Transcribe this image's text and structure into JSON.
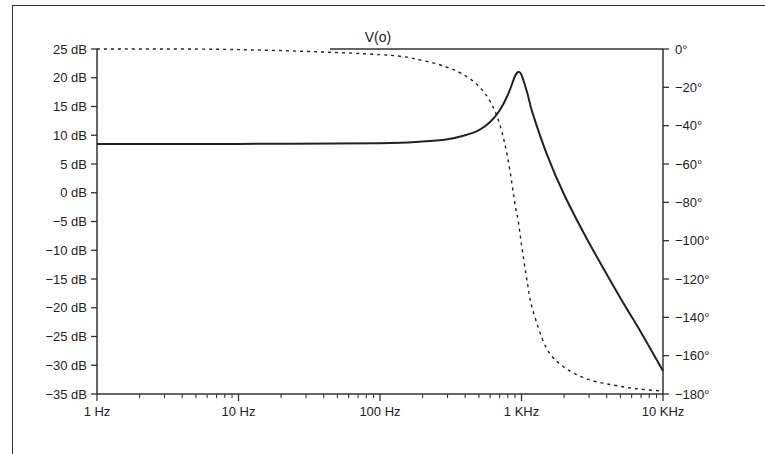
{
  "chart_data": {
    "type": "line",
    "title": "V(o)",
    "xlabel": "",
    "ylabel": "",
    "xscale": "log",
    "x_ticks": [
      "1 Hz",
      "10 Hz",
      "100 Hz",
      "1 KHz",
      "10 KHz"
    ],
    "xlim": [
      1,
      10000
    ],
    "y_left": {
      "unit": "dB",
      "ylim": [
        -35,
        25
      ],
      "ticks": [
        "25 dB",
        "20 dB",
        "15 dB",
        "10 dB",
        "5 dB",
        "0 dB",
        "−5 dB",
        "−10 dB",
        "−15 dB",
        "−20 dB",
        "−25 dB",
        "−30 dB",
        "−35 dB"
      ]
    },
    "y_right": {
      "unit": "deg",
      "ylim": [
        -180,
        0
      ],
      "ticks": [
        "0°",
        "−20°",
        "−40°",
        "−60°",
        "−80°",
        "−100°",
        "−120°",
        "−140°",
        "−160°",
        "−180°"
      ]
    },
    "grid": false,
    "series": [
      {
        "name": "Magnitude",
        "axis": "left",
        "style": "solid",
        "x": [
          1,
          10,
          100,
          200,
          300,
          400,
          500,
          600,
          700,
          800,
          900,
          950,
          1000,
          1100,
          1200,
          1500,
          2000,
          3000,
          5000,
          7000,
          10000
        ],
        "values": [
          8.5,
          8.5,
          8.6,
          8.9,
          9.3,
          10.0,
          10.9,
          12.3,
          14.3,
          17.0,
          20.3,
          21.0,
          20.5,
          17.3,
          13.8,
          6.9,
          -0.3,
          -8.7,
          -18.3,
          -24.3,
          -31.0
        ]
      },
      {
        "name": "Phase",
        "axis": "right",
        "style": "dashed",
        "x": [
          1,
          10,
          100,
          200,
          300,
          400,
          500,
          600,
          700,
          800,
          900,
          950,
          1000,
          1100,
          1200,
          1500,
          2000,
          3000,
          5000,
          7000,
          10000
        ],
        "values": [
          0,
          -0.3,
          -2.9,
          -6.0,
          -9.6,
          -13.9,
          -19.5,
          -27.3,
          -39.0,
          -57.0,
          -81.0,
          -90.0,
          -102.0,
          -122.0,
          -136.0,
          -156.0,
          -166.0,
          -172.5,
          -176.0,
          -177.5,
          -178.5
        ]
      }
    ]
  }
}
